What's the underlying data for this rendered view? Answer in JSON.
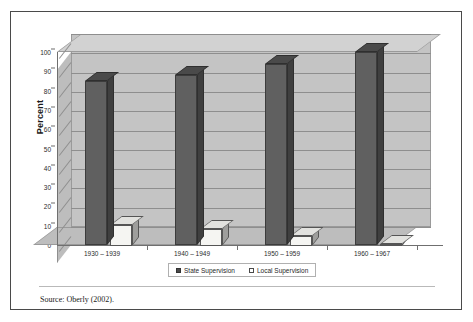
{
  "figure": {
    "source_note": "Source: Oberly (2002)."
  },
  "chart_data": {
    "type": "bar",
    "title": "",
    "subtitle": "",
    "xlabel": "",
    "ylabel": "Percent",
    "ylim": [
      0,
      100
    ],
    "y_ticks": [
      0,
      10,
      20,
      30,
      40,
      50,
      60,
      70,
      80,
      90,
      100
    ],
    "y_tick_labels": [
      "0",
      "10",
      "20",
      "30",
      "40",
      "50",
      "60",
      "70",
      "80",
      "90",
      "100"
    ],
    "grid": true,
    "legend_position": "bottom",
    "three_d": true,
    "categories": [
      "1930 – 1939",
      "1940 – 1949",
      "1950 – 1959",
      "1960 – 1967"
    ],
    "series": [
      {
        "name": "State Supervision",
        "color": "#606060",
        "values": [
          85,
          88,
          94,
          100
        ]
      },
      {
        "name": "Local Supervision",
        "color": "#f5f5f2",
        "values": [
          11,
          9,
          5,
          1
        ]
      }
    ]
  },
  "legend": {
    "entries": [
      {
        "label": "State Supervision"
      },
      {
        "label": "Local Supervision"
      }
    ]
  },
  "colors": {
    "frame": "#4a4a4a",
    "plot_wall": "#c4c4c4",
    "plot_floor": "#bdbdbd",
    "gridline": "#8e8e8e",
    "series_state": "#606060",
    "series_local": "#f5f5f2"
  }
}
